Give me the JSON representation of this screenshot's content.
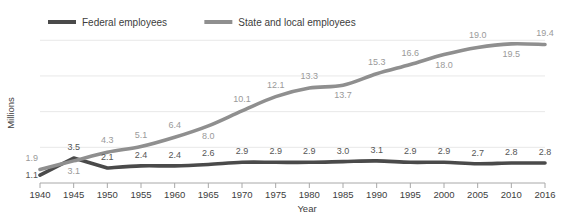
{
  "chart_data": {
    "type": "line",
    "title": "",
    "xlabel": "Year",
    "ylabel": "Millions",
    "categories": [
      "1940",
      "1945",
      "1950",
      "1955",
      "1960",
      "1965",
      "1970",
      "1975",
      "1980",
      "1985",
      "1990",
      "1995",
      "2000",
      "2005",
      "2010",
      "2016"
    ],
    "x": [
      1940,
      1945,
      1950,
      1955,
      1960,
      1965,
      1970,
      1975,
      1980,
      1985,
      1990,
      1995,
      2000,
      2005,
      2010,
      2016
    ],
    "xlim": [
      1940,
      2016
    ],
    "ylim": [
      0,
      22
    ],
    "grid": true,
    "gridlines_y": [
      5,
      10,
      15,
      20
    ],
    "legend_position": "top-left",
    "series": [
      {
        "name": "Federal employees",
        "color": "#4a4a4a",
        "values": [
          1.1,
          3.5,
          2.1,
          2.4,
          2.4,
          2.6,
          2.9,
          2.9,
          2.9,
          3.0,
          3.1,
          2.9,
          2.9,
          2.7,
          2.8,
          2.8
        ],
        "labels": [
          "1.1",
          "3.5",
          "2.1",
          "2.4",
          "2.4",
          "2.6",
          "2.9",
          "2.9",
          "2.9",
          "3.0",
          "3.1",
          "2.9",
          "2.9",
          "2.7",
          "2.8",
          "2.8"
        ]
      },
      {
        "name": "State and local employees",
        "color": "#8f8f8f",
        "values": [
          1.9,
          3.1,
          4.3,
          5.1,
          6.4,
          8.0,
          10.1,
          12.1,
          13.3,
          13.7,
          15.3,
          16.6,
          18.0,
          19.0,
          19.5,
          19.4
        ],
        "labels": [
          "1.9",
          "3.1",
          "4.3",
          "5.1",
          "6.4",
          "8.0",
          "10.1",
          "12.1",
          "13.3",
          "13.7",
          "15.3",
          "16.6",
          "18.0",
          "19.0",
          "19.5",
          "19.4"
        ]
      }
    ]
  },
  "legend": {
    "items": [
      {
        "label": "Federal employees",
        "color": "#4a4a4a"
      },
      {
        "label": "State and local employees",
        "color": "#8f8f8f"
      }
    ]
  },
  "axes": {
    "y_title": "Millions",
    "x_title": "Year",
    "x_tick_labels": [
      "1940",
      "1945",
      "1950",
      "1955",
      "1960",
      "1965",
      "1970",
      "1975",
      "1980",
      "1985",
      "1990",
      "1995",
      "2000",
      "2005",
      "2010",
      "2016"
    ]
  },
  "colors": {
    "background": "#ffffff",
    "federal": "#4a4a4a",
    "state_local": "#8f8f8f",
    "grid": "#e8e8e8",
    "axis": "#a8a8a8",
    "text": "#3d3d3d"
  }
}
